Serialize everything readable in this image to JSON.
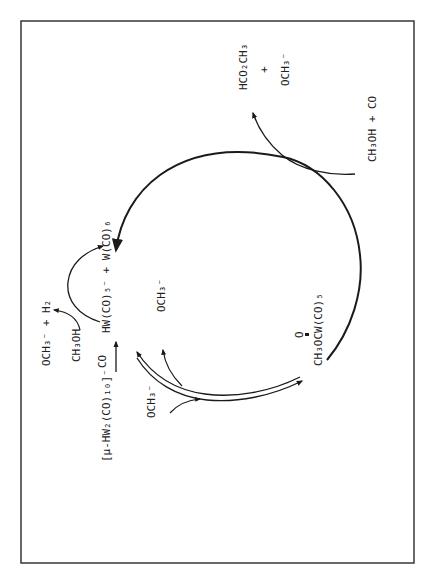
{
  "diagram": {
    "type": "catalytic-cycle",
    "orientation": "rotated-90-ccw",
    "colors": {
      "line": "#1a1a1a",
      "text": "#222222",
      "frame": "#2a2a2a",
      "background": "#ffffff"
    },
    "precursor": {
      "formula": "[μ-HW₂(CO)₁₀]⁻",
      "arrow_reagent": "CO"
    },
    "catalyst": {
      "formula": "HW(CO)₅⁻ + W(CO)₆"
    },
    "side_reaction": {
      "reactant": "CH₃OH",
      "products": "OCH₃⁻ + H₂"
    },
    "equilibrium": {
      "input": "OCH₃⁻",
      "output": "OCH₃⁻"
    },
    "intermediate": {
      "carbonyl_o": "O",
      "formula": "CH₃OCW(CO)₅"
    },
    "feed": {
      "reactants": "CH₃OH + CO"
    },
    "products": {
      "ester": "HCO₂CH₃",
      "plus": "+",
      "base": "OCH₃⁻"
    }
  }
}
